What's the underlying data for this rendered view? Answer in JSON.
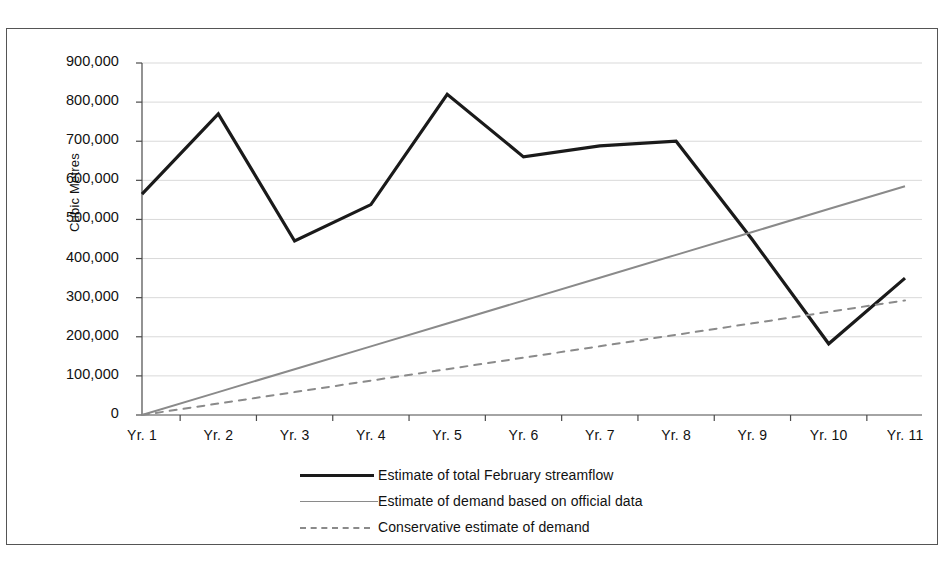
{
  "chart_data": {
    "type": "line",
    "title": "",
    "subtitle": "",
    "xlabel": "",
    "ylabel": "Cubic Metres",
    "categories": [
      "Yr. 1",
      "Yr. 2",
      "Yr. 3",
      "Yr. 4",
      "Yr. 5",
      "Yr. 6",
      "Yr. 7",
      "Yr. 8",
      "Yr. 9",
      "Yr. 10",
      "Yr. 11"
    ],
    "ylim": [
      0,
      900000
    ],
    "ytick_labels": [
      "900,000",
      "800,000",
      "700,000",
      "600,000",
      "500,000",
      "400,000",
      "300,000",
      "200,000",
      "100,000",
      "0"
    ],
    "ytick_values": [
      900000,
      800000,
      700000,
      600000,
      500000,
      400000,
      300000,
      200000,
      100000,
      0
    ],
    "grid": true,
    "grid_axis": "y",
    "legend_position": "bottom",
    "series": [
      {
        "name": "Estimate of total February streamflow",
        "style": "solid",
        "color": "#1a1a1a",
        "width": 3.2,
        "values": [
          565000,
          770000,
          445000,
          538000,
          820000,
          660000,
          688000,
          700000,
          448000,
          182000,
          350000
        ]
      },
      {
        "name": "Estimate of demand based on official data",
        "style": "solid",
        "color": "#8a8a8a",
        "width": 2.0,
        "values": [
          0,
          58500,
          117000,
          175500,
          234000,
          292500,
          351000,
          409500,
          468000,
          526500,
          585000
        ]
      },
      {
        "name": "Conservative estimate of demand",
        "style": "dashed",
        "color": "#8a8a8a",
        "width": 2.0,
        "values": [
          0,
          29300,
          58600,
          87900,
          117200,
          146500,
          175800,
          205100,
          234400,
          263700,
          293000
        ]
      }
    ]
  },
  "legend": {
    "items": [
      {
        "label": "Estimate of total February streamflow",
        "key": "solid-bold-black"
      },
      {
        "label": "Estimate of demand based on official data",
        "key": "solid-grey"
      },
      {
        "label": "Conservative estimate of demand",
        "key": "dashed-grey"
      }
    ]
  },
  "colors": {
    "streamflow": "#1a1a1a",
    "demand_official": "#8a8a8a",
    "demand_conservative": "#8a8a8a",
    "axis": "#4a4a4a",
    "grid": "#d9d9d9",
    "frame": "#555555",
    "background": "#ffffff"
  }
}
